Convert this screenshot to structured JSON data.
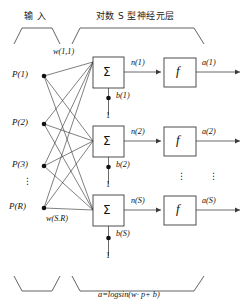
{
  "diagram": {
    "title_input": "输 入",
    "title_layer": "对数 S 型神经元层",
    "formula": "a=logsin(w· p+ b)",
    "colors": {
      "stroke": "#3a3a3a",
      "text": "#111111",
      "background": "#ffffff"
    }
  },
  "inputs": {
    "label_p1": "P(1)",
    "label_p2": "P(2)",
    "label_p3": "P(3)",
    "label_dots": "⋮",
    "label_pr": "P(R)"
  },
  "weights": {
    "first": "w(1,1)",
    "last": "w(S.R)"
  },
  "neurons": [
    {
      "sum_symbol": "Σ",
      "net_label": "n(1)",
      "bias_label": "b(1)",
      "bias_input": "1",
      "activation_symbol": "f",
      "output_label": "a(1)"
    },
    {
      "sum_symbol": "Σ",
      "net_label": "n(2)",
      "bias_label": "b(2)",
      "bias_input": "1",
      "activation_symbol": "f",
      "output_label": "a(2)"
    },
    {
      "sum_symbol": "Σ",
      "net_label": "n(S)",
      "bias_label": "b(S)",
      "bias_input": "1",
      "activation_symbol": "f",
      "output_label": "a(S)"
    }
  ],
  "ellipses": {
    "mid_activation": "⋮",
    "mid_output": "⋮"
  }
}
